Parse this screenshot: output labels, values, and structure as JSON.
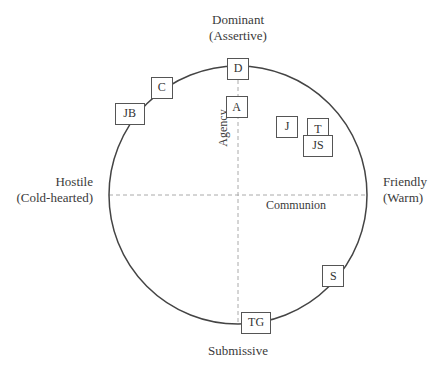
{
  "diagram": {
    "type": "interpersonal-circumplex",
    "axes": {
      "vertical_label": "Agency",
      "horizontal_label": "Communion"
    },
    "poles": {
      "top": [
        "Dominant",
        "(Assertive)"
      ],
      "bottom": [
        "Submissive"
      ],
      "left": [
        "Hostile",
        "(Cold-hearted)"
      ],
      "right": [
        "Friendly",
        "(Warm)"
      ]
    },
    "colors": {
      "circle": "#444444",
      "axis": "#aaaaaa",
      "box_border": "#555555",
      "text": "#3a3a3a"
    },
    "points": [
      {
        "label": "D",
        "communion": 0.0,
        "agency": 0.98
      },
      {
        "label": "C",
        "communion": -0.59,
        "agency": 0.83
      },
      {
        "label": "JB",
        "communion": -0.84,
        "agency": 0.63
      },
      {
        "label": "A",
        "communion": -0.01,
        "agency": 0.68
      },
      {
        "label": "J",
        "communion": 0.38,
        "agency": 0.53
      },
      {
        "label": "T",
        "communion": 0.62,
        "agency": 0.51
      },
      {
        "label": "JS",
        "communion": 0.62,
        "agency": 0.38
      },
      {
        "label": "S",
        "communion": 0.74,
        "agency": -0.63
      },
      {
        "label": "TG",
        "communion": 0.14,
        "agency": -0.99
      }
    ]
  }
}
